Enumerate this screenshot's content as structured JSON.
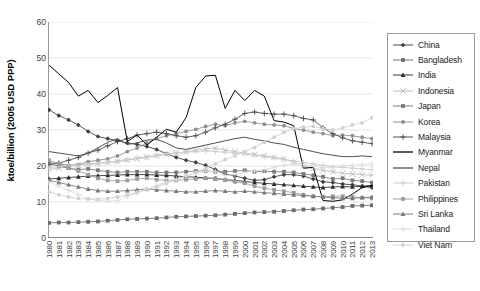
{
  "chart_data": {
    "type": "line",
    "title": "",
    "xlabel": "",
    "ylabel": "ktoe/billion (2005 USD PPP)",
    "ylim": [
      0,
      60
    ],
    "yticks": [
      0,
      10,
      20,
      30,
      40,
      50,
      60
    ],
    "grid": true,
    "legend_position": "right",
    "x": [
      1980,
      1981,
      1982,
      1983,
      1984,
      1985,
      1986,
      1987,
      1988,
      1989,
      1990,
      1991,
      1992,
      1993,
      1994,
      1995,
      1996,
      1997,
      1998,
      1999,
      2000,
      2001,
      2002,
      2003,
      2004,
      2005,
      2006,
      2007,
      2008,
      2009,
      2010,
      2011,
      2012,
      2013
    ],
    "categories": [
      "1980",
      "1981",
      "1982",
      "1983",
      "1984",
      "1985",
      "1986",
      "1987",
      "1988",
      "1989",
      "1990",
      "1991",
      "1992",
      "1993",
      "1994",
      "1995",
      "1996",
      "1997",
      "1998",
      "1999",
      "2000",
      "2001",
      "2002",
      "2003",
      "2004",
      "2005",
      "2006",
      "2007",
      "2008",
      "2009",
      "2010",
      "2011",
      "2012",
      "2013"
    ],
    "series": [
      {
        "name": "China",
        "color": "#3f3f3f",
        "marker": "diamond",
        "values": [
          35.6,
          34.0,
          32.8,
          31.4,
          29.6,
          28.2,
          27.6,
          27.0,
          26.4,
          26.0,
          25.4,
          24.6,
          23.4,
          22.4,
          21.6,
          21.0,
          20.2,
          19.0,
          17.8,
          17.2,
          16.6,
          16.0,
          16.2,
          17.0,
          17.6,
          17.6,
          17.2,
          16.4,
          15.6,
          15.4,
          15.0,
          14.8,
          14.4,
          14.0
        ]
      },
      {
        "name": "Bangladesh",
        "color": "#6b6b6b",
        "marker": "square",
        "values": [
          4.2,
          4.3,
          4.3,
          4.4,
          4.5,
          4.6,
          4.8,
          5.0,
          5.2,
          5.3,
          5.4,
          5.5,
          5.7,
          5.9,
          6.0,
          6.1,
          6.2,
          6.3,
          6.5,
          6.7,
          6.9,
          7.1,
          7.2,
          7.3,
          7.5,
          7.7,
          7.9,
          8.0,
          8.2,
          8.4,
          8.6,
          8.9,
          9.0,
          9.1
        ]
      },
      {
        "name": "India",
        "color": "#2b2b2b",
        "marker": "triangle",
        "values": [
          16.4,
          16.6,
          16.8,
          17.0,
          17.2,
          17.3,
          17.4,
          17.5,
          17.6,
          17.6,
          17.6,
          17.5,
          17.4,
          17.2,
          17.0,
          16.9,
          16.7,
          16.5,
          16.2,
          16.0,
          15.7,
          15.4,
          15.2,
          15.0,
          14.8,
          14.6,
          14.4,
          14.2,
          14.0,
          14.2,
          14.3,
          14.2,
          14.4,
          14.6
        ]
      },
      {
        "name": "Indonesia",
        "color": "#b8b8b8",
        "marker": "cross",
        "values": [
          19.0,
          19.4,
          19.8,
          20.2,
          20.6,
          20.8,
          21.0,
          21.2,
          21.6,
          22.0,
          22.4,
          22.8,
          23.2,
          23.6,
          24.0,
          24.4,
          24.8,
          25.0,
          24.4,
          24.0,
          23.6,
          23.2,
          22.8,
          22.4,
          22.0,
          21.0,
          20.0,
          19.4,
          18.8,
          18.4,
          18.0,
          17.8,
          17.6,
          17.4
        ]
      },
      {
        "name": "Japan",
        "color": "#7a7a7a",
        "marker": "square",
        "values": [
          20.6,
          20.0,
          19.4,
          19.0,
          19.2,
          18.8,
          18.4,
          18.2,
          18.4,
          18.4,
          18.4,
          18.2,
          18.2,
          18.2,
          18.4,
          18.6,
          18.6,
          18.4,
          18.4,
          18.6,
          18.8,
          18.4,
          18.6,
          18.4,
          18.4,
          18.2,
          17.8,
          17.4,
          17.0,
          16.4,
          16.6,
          16.0,
          15.8,
          15.4
        ]
      },
      {
        "name": "Korea",
        "color": "#8f8f8f",
        "marker": "circle",
        "values": [
          21.0,
          20.6,
          20.2,
          20.4,
          21.2,
          21.6,
          22.0,
          22.8,
          24.0,
          25.0,
          26.4,
          27.6,
          28.4,
          29.0,
          29.6,
          30.2,
          31.0,
          31.6,
          31.2,
          32.0,
          32.4,
          32.0,
          31.6,
          31.4,
          31.2,
          30.4,
          30.0,
          29.4,
          29.0,
          28.4,
          28.6,
          28.4,
          28.0,
          27.6
        ]
      },
      {
        "name": "Malaysia",
        "color": "#4a4a4a",
        "marker": "plus",
        "values": [
          20.4,
          20.8,
          21.6,
          22.4,
          23.6,
          24.4,
          25.6,
          26.8,
          27.6,
          28.6,
          29.0,
          29.4,
          29.0,
          28.4,
          28.0,
          28.4,
          29.4,
          30.6,
          31.6,
          33.0,
          34.6,
          35.0,
          34.6,
          34.4,
          34.4,
          34.0,
          33.2,
          32.8,
          30.6,
          29.0,
          27.8,
          27.0,
          26.6,
          26.2
        ]
      },
      {
        "name": "Myanmar",
        "color": "#000000",
        "marker": "none",
        "values": [
          48.0,
          45.6,
          43.2,
          39.4,
          41.0,
          37.6,
          39.6,
          41.8,
          26.8,
          28.6,
          25.8,
          28.0,
          30.2,
          29.4,
          33.4,
          41.8,
          45.0,
          45.2,
          36.0,
          41.0,
          38.2,
          41.0,
          39.4,
          32.6,
          32.2,
          31.2,
          19.4,
          19.6,
          10.4,
          10.2,
          10.6,
          12.2,
          14.0,
          14.6
        ]
      },
      {
        "name": "Nepal",
        "color": "#4f4f4f",
        "marker": "none",
        "values": [
          24.0,
          23.6,
          23.2,
          22.8,
          23.6,
          25.0,
          26.6,
          27.6,
          26.0,
          26.4,
          27.2,
          27.4,
          26.4,
          25.0,
          24.6,
          25.2,
          25.8,
          26.4,
          27.0,
          27.6,
          28.0,
          27.4,
          27.0,
          26.4,
          26.0,
          25.2,
          24.6,
          24.0,
          23.4,
          23.0,
          22.6,
          22.6,
          22.8,
          22.6
        ]
      },
      {
        "name": "Pakistan",
        "color": "#cccccc",
        "marker": "plus",
        "values": [
          19.6,
          19.8,
          20.0,
          20.2,
          20.4,
          20.6,
          21.0,
          21.4,
          21.8,
          22.2,
          22.6,
          23.0,
          23.4,
          23.6,
          23.8,
          24.0,
          24.2,
          24.0,
          23.8,
          23.6,
          23.4,
          23.0,
          22.6,
          22.2,
          21.8,
          21.4,
          21.0,
          20.6,
          20.2,
          19.8,
          19.6,
          19.4,
          19.2,
          19.0
        ]
      },
      {
        "name": "Philippines",
        "color": "#9c9c9c",
        "marker": "square",
        "values": [
          21.6,
          20.6,
          19.4,
          18.6,
          17.6,
          16.6,
          16.0,
          15.8,
          16.0,
          16.4,
          16.6,
          16.2,
          16.0,
          16.0,
          16.2,
          16.4,
          16.6,
          16.6,
          16.2,
          15.6,
          15.2,
          14.4,
          13.8,
          13.4,
          13.0,
          12.6,
          12.0,
          11.6,
          11.4,
          11.6,
          11.6,
          11.4,
          11.2,
          11.0
        ]
      },
      {
        "name": "Sri Lanka",
        "color": "#777777",
        "marker": "triangle",
        "values": [
          16.0,
          15.4,
          14.8,
          14.2,
          13.6,
          13.2,
          13.0,
          13.0,
          13.2,
          13.4,
          13.6,
          13.4,
          13.2,
          13.0,
          12.8,
          12.8,
          13.0,
          13.2,
          13.0,
          12.8,
          13.0,
          12.8,
          12.6,
          12.4,
          12.2,
          12.0,
          11.8,
          11.6,
          11.4,
          11.2,
          11.0,
          11.0,
          11.2,
          11.4
        ]
      },
      {
        "name": "Thailand",
        "color": "#dcdcdc",
        "marker": "plus",
        "values": [
          15.6,
          14.4,
          13.2,
          12.0,
          11.0,
          10.4,
          10.2,
          10.4,
          11.4,
          12.6,
          13.6,
          14.6,
          15.6,
          16.4,
          17.2,
          18.0,
          18.6,
          18.4,
          17.4,
          17.6,
          18.2,
          18.6,
          19.0,
          19.6,
          20.2,
          20.6,
          20.4,
          20.0,
          19.6,
          19.6,
          20.0,
          20.2,
          20.4,
          20.6
        ]
      },
      {
        "name": "Viet Nam",
        "color": "#d0d0d0",
        "marker": "circle",
        "values": [
          12.8,
          12.0,
          11.4,
          11.0,
          10.8,
          10.8,
          11.0,
          11.4,
          12.0,
          12.6,
          13.4,
          14.2,
          15.2,
          16.2,
          17.2,
          18.2,
          19.4,
          20.6,
          21.8,
          22.8,
          24.0,
          25.2,
          26.6,
          28.0,
          29.4,
          30.4,
          30.8,
          31.0,
          30.4,
          30.0,
          30.6,
          31.4,
          32.0,
          33.4
        ]
      }
    ]
  },
  "legend": {
    "items": [
      {
        "label": "China"
      },
      {
        "label": "Bangladesh"
      },
      {
        "label": "India"
      },
      {
        "label": "Indonesia"
      },
      {
        "label": "Japan"
      },
      {
        "label": "Korea"
      },
      {
        "label": "Malaysia"
      },
      {
        "label": "Myanmar"
      },
      {
        "label": "Nepal"
      },
      {
        "label": "Pakistan"
      },
      {
        "label": "Philippines"
      },
      {
        "label": "Sri Lanka"
      },
      {
        "label": "Thailand"
      },
      {
        "label": "Viet Nam"
      }
    ]
  }
}
